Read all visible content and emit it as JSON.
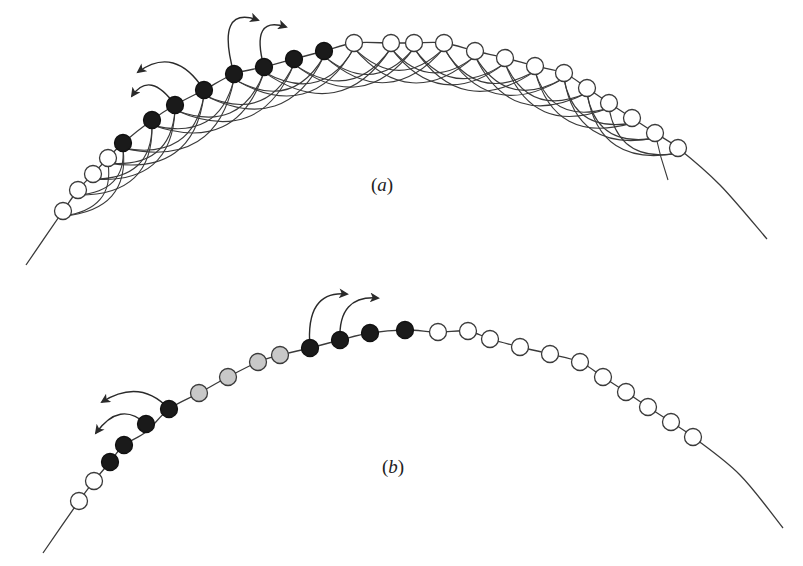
{
  "colors": {
    "stroke": "#3a3a3a",
    "filled": "#1a1a1a",
    "open": "#ffffff",
    "grey": "#c8c8c8",
    "background": "#ffffff"
  },
  "node_radius": 8.5,
  "panels": [
    {
      "id": "a",
      "label": "a",
      "label_pos": [
        382,
        185
      ],
      "curve": [
        [
          26,
          265
        ],
        [
          63,
          211
        ],
        [
          78,
          190
        ],
        [
          93,
          174
        ],
        [
          108,
          158
        ],
        [
          123,
          143
        ],
        [
          152,
          120
        ],
        [
          175,
          105
        ],
        [
          204,
          90
        ],
        [
          234,
          74
        ],
        [
          264,
          67
        ],
        [
          294,
          59
        ],
        [
          324,
          51
        ],
        [
          354,
          43
        ],
        [
          391,
          43
        ],
        [
          414,
          43
        ],
        [
          444,
          43
        ],
        [
          475,
          51
        ],
        [
          505,
          58
        ],
        [
          535,
          66
        ],
        [
          564,
          73
        ],
        [
          587,
          88
        ],
        [
          609,
          103
        ],
        [
          632,
          118
        ],
        [
          655,
          133
        ],
        [
          678,
          148
        ],
        [
          720,
          185
        ],
        [
          767,
          239
        ]
      ],
      "nodes": [
        {
          "x": 63,
          "y": 211,
          "state": "open"
        },
        {
          "x": 78,
          "y": 190,
          "state": "open"
        },
        {
          "x": 93,
          "y": 174,
          "state": "open"
        },
        {
          "x": 108,
          "y": 158,
          "state": "open"
        },
        {
          "x": 123,
          "y": 143,
          "state": "filled"
        },
        {
          "x": 152,
          "y": 120,
          "state": "filled"
        },
        {
          "x": 175,
          "y": 105,
          "state": "filled"
        },
        {
          "x": 204,
          "y": 90,
          "state": "filled"
        },
        {
          "x": 234,
          "y": 74,
          "state": "filled"
        },
        {
          "x": 264,
          "y": 67,
          "state": "filled"
        },
        {
          "x": 294,
          "y": 59,
          "state": "filled"
        },
        {
          "x": 324,
          "y": 51,
          "state": "filled"
        },
        {
          "x": 354,
          "y": 43,
          "state": "open"
        },
        {
          "x": 391,
          "y": 43,
          "state": "open"
        },
        {
          "x": 414,
          "y": 43,
          "state": "open"
        },
        {
          "x": 444,
          "y": 43,
          "state": "open"
        },
        {
          "x": 475,
          "y": 51,
          "state": "open"
        },
        {
          "x": 505,
          "y": 58,
          "state": "open"
        },
        {
          "x": 535,
          "y": 66,
          "state": "open"
        },
        {
          "x": 564,
          "y": 73,
          "state": "open"
        },
        {
          "x": 587,
          "y": 88,
          "state": "open"
        },
        {
          "x": 609,
          "y": 103,
          "state": "open"
        },
        {
          "x": 632,
          "y": 118,
          "state": "open"
        },
        {
          "x": 655,
          "y": 133,
          "state": "open"
        },
        {
          "x": 678,
          "y": 148,
          "state": "open"
        }
      ],
      "links": {
        "spans": [
          3,
          4
        ],
        "sag": 0.55,
        "extra_tail": [
          [
            655,
            133
          ],
          [
            668,
            180
          ]
        ]
      },
      "arrows": [
        {
          "from": [
            204,
            90
          ],
          "ctrl": [
            175,
            45
          ],
          "to": [
            138,
            72
          ]
        },
        {
          "from": [
            175,
            105
          ],
          "ctrl": [
            150,
            70
          ],
          "to": [
            132,
            96
          ]
        },
        {
          "from": [
            234,
            74
          ],
          "ctrl": [
            215,
            5
          ],
          "to": [
            258,
            20
          ]
        },
        {
          "from": [
            264,
            67
          ],
          "ctrl": [
            250,
            15
          ],
          "to": [
            286,
            27
          ]
        }
      ]
    },
    {
      "id": "b",
      "label": "b",
      "label_pos": [
        393,
        467
      ],
      "curve": [
        [
          43,
          553
        ],
        [
          79,
          501
        ],
        [
          94,
          481
        ],
        [
          110,
          462
        ],
        [
          124,
          445
        ],
        [
          146,
          432
        ],
        [
          169,
          409
        ],
        [
          199,
          393
        ],
        [
          228,
          377
        ],
        [
          258,
          362
        ],
        [
          280,
          355
        ],
        [
          310,
          348
        ],
        [
          340,
          340
        ],
        [
          370,
          333
        ],
        [
          405,
          330
        ],
        [
          438,
          332
        ],
        [
          468,
          331
        ],
        [
          490,
          339
        ],
        [
          520,
          347
        ],
        [
          550,
          354
        ],
        [
          580,
          362
        ],
        [
          603,
          377
        ],
        [
          626,
          392
        ],
        [
          648,
          407
        ],
        [
          671,
          422
        ],
        [
          693,
          437
        ],
        [
          740,
          475
        ],
        [
          783,
          528
        ]
      ],
      "nodes": [
        {
          "x": 79,
          "y": 501,
          "state": "open"
        },
        {
          "x": 94,
          "y": 481,
          "state": "open"
        },
        {
          "x": 110,
          "y": 462,
          "state": "filled"
        },
        {
          "x": 124,
          "y": 445,
          "state": "filled"
        },
        {
          "x": 146,
          "y": 424,
          "state": "filled"
        },
        {
          "x": 169,
          "y": 409,
          "state": "filled"
        },
        {
          "x": 199,
          "y": 393,
          "state": "grey"
        },
        {
          "x": 228,
          "y": 377,
          "state": "grey"
        },
        {
          "x": 258,
          "y": 362,
          "state": "grey"
        },
        {
          "x": 280,
          "y": 355,
          "state": "grey"
        },
        {
          "x": 310,
          "y": 348,
          "state": "filled"
        },
        {
          "x": 340,
          "y": 340,
          "state": "filled"
        },
        {
          "x": 370,
          "y": 333,
          "state": "filled"
        },
        {
          "x": 405,
          "y": 330,
          "state": "filled"
        },
        {
          "x": 438,
          "y": 332,
          "state": "open"
        },
        {
          "x": 468,
          "y": 331,
          "state": "open"
        },
        {
          "x": 490,
          "y": 339,
          "state": "open"
        },
        {
          "x": 520,
          "y": 347,
          "state": "open"
        },
        {
          "x": 550,
          "y": 354,
          "state": "open"
        },
        {
          "x": 580,
          "y": 362,
          "state": "open"
        },
        {
          "x": 603,
          "y": 377,
          "state": "open"
        },
        {
          "x": 626,
          "y": 392,
          "state": "open"
        },
        {
          "x": 648,
          "y": 407,
          "state": "open"
        },
        {
          "x": 671,
          "y": 422,
          "state": "open"
        },
        {
          "x": 693,
          "y": 437,
          "state": "open"
        }
      ],
      "links": null,
      "arrows": [
        {
          "from": [
            169,
            409
          ],
          "ctrl": [
            140,
            378
          ],
          "to": [
            102,
            402
          ]
        },
        {
          "from": [
            146,
            424
          ],
          "ctrl": [
            120,
            400
          ],
          "to": [
            96,
            433
          ]
        },
        {
          "from": [
            310,
            348
          ],
          "ctrl": [
            305,
            290
          ],
          "to": [
            347,
            294
          ]
        },
        {
          "from": [
            340,
            340
          ],
          "ctrl": [
            338,
            295
          ],
          "to": [
            378,
            298
          ]
        }
      ]
    }
  ]
}
